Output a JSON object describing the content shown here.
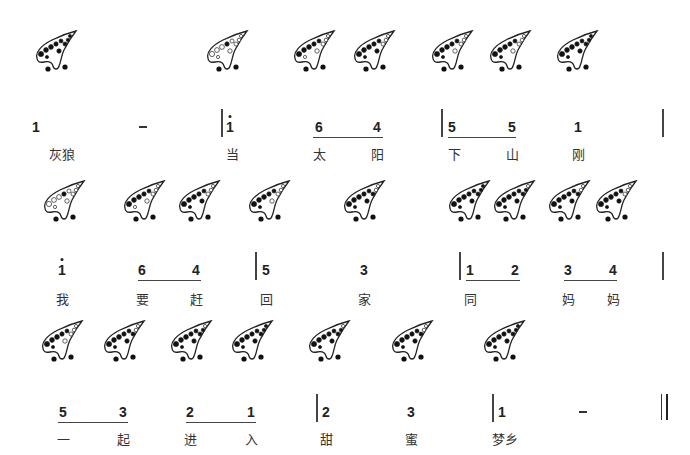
{
  "rows": [
    {
      "ocarinas": [
        {
          "x": 32,
          "y": 30,
          "fingering": "do"
        },
        {
          "x": 203,
          "y": 30,
          "fingering": "do-high"
        },
        {
          "x": 290,
          "y": 30,
          "fingering": "la"
        },
        {
          "x": 350,
          "y": 30,
          "fingering": "fa"
        },
        {
          "x": 428,
          "y": 30,
          "fingering": "sol"
        },
        {
          "x": 486,
          "y": 30,
          "fingering": "sol"
        },
        {
          "x": 553,
          "y": 30,
          "fingering": "do"
        }
      ],
      "notes": [
        {
          "x": 36,
          "text": "1"
        },
        {
          "x": 143,
          "text": "-"
        },
        {
          "x": 230,
          "text": "i"
        },
        {
          "x": 319,
          "text": "6"
        },
        {
          "x": 377,
          "text": "4"
        },
        {
          "x": 452,
          "text": "5"
        },
        {
          "x": 512,
          "text": "5"
        },
        {
          "x": 578,
          "text": "1"
        }
      ],
      "lyrics": [
        {
          "x": 62,
          "text": "灰狼"
        },
        {
          "x": 232,
          "text": "当"
        },
        {
          "x": 319,
          "text": "太"
        },
        {
          "x": 377,
          "text": "阳"
        },
        {
          "x": 454,
          "text": "下"
        },
        {
          "x": 512,
          "text": "山"
        },
        {
          "x": 578,
          "text": "刚"
        }
      ],
      "note_y": 119,
      "lyric_y": 144,
      "bars": [
        221,
        441,
        662
      ],
      "beams": [
        {
          "x1": 313,
          "x2": 383
        },
        {
          "x1": 448,
          "x2": 516
        }
      ]
    },
    {
      "ocarinas": [
        {
          "x": 40,
          "y": 180,
          "fingering": "do-high"
        },
        {
          "x": 120,
          "y": 180,
          "fingering": "la"
        },
        {
          "x": 175,
          "y": 180,
          "fingering": "fa"
        },
        {
          "x": 245,
          "y": 180,
          "fingering": "sol"
        },
        {
          "x": 340,
          "y": 180,
          "fingering": "mi"
        },
        {
          "x": 445,
          "y": 180,
          "fingering": "do"
        },
        {
          "x": 490,
          "y": 180,
          "fingering": "re"
        },
        {
          "x": 545,
          "y": 180,
          "fingering": "mi"
        },
        {
          "x": 592,
          "y": 180,
          "fingering": "fa"
        }
      ],
      "notes": [
        {
          "x": 62,
          "text": "i"
        },
        {
          "x": 142,
          "text": "6"
        },
        {
          "x": 196,
          "text": "4"
        },
        {
          "x": 266,
          "text": "5"
        },
        {
          "x": 364,
          "text": "3"
        },
        {
          "x": 470,
          "text": "1"
        },
        {
          "x": 515,
          "text": "2"
        },
        {
          "x": 568,
          "text": "3"
        },
        {
          "x": 613,
          "text": "4"
        }
      ],
      "lyrics": [
        {
          "x": 62,
          "text": "我"
        },
        {
          "x": 142,
          "text": "要"
        },
        {
          "x": 196,
          "text": "赶"
        },
        {
          "x": 266,
          "text": "回"
        },
        {
          "x": 364,
          "text": "家"
        },
        {
          "x": 470,
          "text": "同"
        },
        {
          "x": 568,
          "text": "妈"
        },
        {
          "x": 613,
          "text": "妈"
        }
      ],
      "note_y": 262,
      "lyric_y": 289,
      "bars": [
        255,
        459,
        662
      ],
      "beams": [
        {
          "x1": 138,
          "x2": 201
        },
        {
          "x1": 466,
          "x2": 520
        },
        {
          "x1": 564,
          "x2": 617
        }
      ]
    },
    {
      "ocarinas": [
        {
          "x": 38,
          "y": 320,
          "fingering": "sol"
        },
        {
          "x": 100,
          "y": 320,
          "fingering": "mi"
        },
        {
          "x": 167,
          "y": 320,
          "fingering": "re"
        },
        {
          "x": 228,
          "y": 320,
          "fingering": "do"
        },
        {
          "x": 305,
          "y": 320,
          "fingering": "re"
        },
        {
          "x": 388,
          "y": 320,
          "fingering": "mi"
        },
        {
          "x": 480,
          "y": 320,
          "fingering": "do"
        }
      ],
      "notes": [
        {
          "x": 63,
          "text": "5"
        },
        {
          "x": 123,
          "text": "3"
        },
        {
          "x": 190,
          "text": "2"
        },
        {
          "x": 251,
          "text": "1"
        },
        {
          "x": 326,
          "text": "2"
        },
        {
          "x": 411,
          "text": "3"
        },
        {
          "x": 502,
          "text": "1"
        },
        {
          "x": 583,
          "text": "-"
        }
      ],
      "lyrics": [
        {
          "x": 63,
          "text": "一"
        },
        {
          "x": 123,
          "text": "起"
        },
        {
          "x": 190,
          "text": "进"
        },
        {
          "x": 251,
          "text": "入"
        },
        {
          "x": 326,
          "text": "甜"
        },
        {
          "x": 411,
          "text": "蜜"
        },
        {
          "x": 505,
          "text": "梦乡"
        }
      ],
      "note_y": 404,
      "lyric_y": 429,
      "bars": [
        316,
        492
      ],
      "double_bar_x": 661,
      "beams": [
        {
          "x1": 58,
          "x2": 128
        },
        {
          "x1": 186,
          "x2": 256
        }
      ]
    }
  ],
  "high_dot_notes": [
    {
      "row": 0,
      "x": 230
    },
    {
      "row": 1,
      "x": 62
    }
  ]
}
